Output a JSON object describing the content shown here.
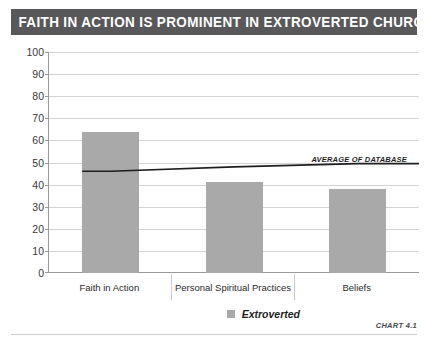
{
  "title": "FAITH IN ACTION IS PROMINENT IN EXTROVERTED CHURCHES",
  "footer": {
    "chart_number": "CHART 4.1"
  },
  "legend": {
    "items": [
      {
        "label": "Extroverted",
        "color": "#a9a9a9"
      }
    ]
  },
  "colors": {
    "title_banner": "#58585a",
    "bar": "#a9a9a9",
    "average_line": "#1f1f1f",
    "gridline": "#d3d3d3",
    "axis": "#9a9a9a"
  },
  "chart_data": {
    "type": "bar",
    "title": "FAITH IN ACTION IS PROMINENT IN EXTROVERTED CHURCHES",
    "xlabel": "",
    "ylabel": "",
    "ylim": [
      0,
      100
    ],
    "yticks": [
      0,
      10,
      20,
      30,
      40,
      50,
      60,
      70,
      80,
      90,
      100
    ],
    "ytick_labels": [
      "0",
      "10",
      "20",
      "30",
      "40",
      "50",
      "60",
      "70",
      "80",
      "90",
      "100"
    ],
    "grid": true,
    "legend_position": "bottom-center",
    "categories": [
      "Faith in Action",
      "Personal Spiritual Practices",
      "Beliefs"
    ],
    "series": [
      {
        "name": "Extroverted",
        "color": "#a9a9a9",
        "values": [
          64,
          41,
          38
        ]
      }
    ],
    "annotations": [
      {
        "type": "line",
        "name": "average-of-database",
        "label": "AVERAGE OF DATABASE",
        "values": [
          46,
          48,
          49.5
        ],
        "color": "#1f1f1f"
      }
    ]
  }
}
